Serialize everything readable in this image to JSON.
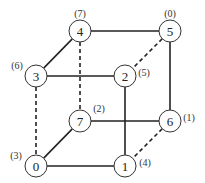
{
  "diagram": {
    "nodes": [
      {
        "id": "0",
        "x": 36,
        "y": 166,
        "label": "(3)",
        "lx": 16,
        "ly": 155
      },
      {
        "id": "1",
        "x": 125,
        "y": 166,
        "label": "(4)",
        "lx": 145,
        "ly": 162
      },
      {
        "id": "2",
        "x": 125,
        "y": 76,
        "label": "(5)",
        "lx": 144,
        "ly": 72
      },
      {
        "id": "3",
        "x": 36,
        "y": 76,
        "label": "(6)",
        "lx": 17,
        "ly": 65
      },
      {
        "id": "4",
        "x": 80,
        "y": 31,
        "label": "(7)",
        "lx": 80,
        "ly": 13
      },
      {
        "id": "5",
        "x": 170,
        "y": 31,
        "label": "(0)",
        "lx": 170,
        "ly": 13
      },
      {
        "id": "6",
        "x": 170,
        "y": 121,
        "label": "(1)",
        "lx": 189,
        "ly": 117
      },
      {
        "id": "7",
        "x": 80,
        "y": 121,
        "label": "(2)",
        "lx": 99,
        "ly": 108
      }
    ],
    "edges": [
      {
        "from": "4",
        "to": "5",
        "style": "solid"
      },
      {
        "from": "4",
        "to": "3",
        "style": "solid"
      },
      {
        "from": "3",
        "to": "2",
        "style": "solid"
      },
      {
        "from": "5",
        "to": "6",
        "style": "solid"
      },
      {
        "from": "2",
        "to": "1",
        "style": "solid"
      },
      {
        "from": "7",
        "to": "6",
        "style": "solid"
      },
      {
        "from": "0",
        "to": "7",
        "style": "solid"
      },
      {
        "from": "0",
        "to": "1",
        "style": "solid"
      },
      {
        "from": "5",
        "to": "2",
        "style": "dashed"
      },
      {
        "from": "4",
        "to": "7",
        "style": "dashed"
      },
      {
        "from": "3",
        "to": "0",
        "style": "dashed"
      },
      {
        "from": "6",
        "to": "1",
        "style": "dashed"
      }
    ],
    "node_radius": 11
  }
}
